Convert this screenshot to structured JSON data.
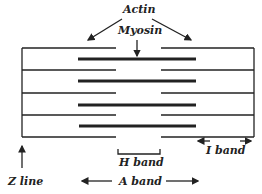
{
  "labels": {
    "actin": "Actin",
    "myosin": "Myosin",
    "h_band": "H band",
    "i_band": "I band",
    "z_line": "Z line",
    "a_band": "A band"
  },
  "colors": {
    "line": "#222222"
  }
}
